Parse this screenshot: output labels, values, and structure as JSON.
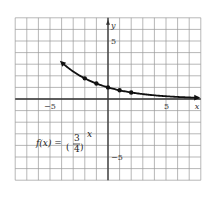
{
  "chart_data": {
    "type": "line",
    "title": "",
    "function_label": {
      "lhs": "f(x) =",
      "numerator": "3",
      "denominator": "4",
      "exponent": "x"
    },
    "xlabel": "x",
    "ylabel": "y",
    "xlim": [
      -8,
      8
    ],
    "ylim": [
      -7,
      7
    ],
    "grid": true,
    "x_tick_labels": [
      {
        "value": -5,
        "label": "−5"
      },
      {
        "value": 5,
        "label": "5"
      }
    ],
    "y_tick_labels": [
      {
        "value": 5,
        "label": "5"
      },
      {
        "value": -5,
        "label": "−5"
      }
    ],
    "marked_points": [
      {
        "x": -2,
        "y": 1.78
      },
      {
        "x": -1,
        "y": 1.33
      },
      {
        "x": 0,
        "y": 1
      },
      {
        "x": 1,
        "y": 0.75
      },
      {
        "x": 2,
        "y": 0.56
      }
    ],
    "curve_domain": [
      -4,
      7.8
    ],
    "arrows_both_ends": true,
    "colors": {
      "grid": "#9a9a9a",
      "axis": "#333333",
      "curve": "#111111",
      "background": "#ffffff"
    }
  }
}
